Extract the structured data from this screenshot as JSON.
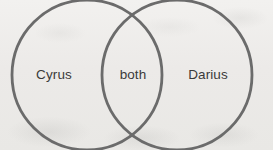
{
  "diagram": {
    "type": "venn-2-set",
    "title": "",
    "background_color": "#edecea",
    "stroke_color": "#6b6b6b",
    "text_color": "#3a3a3a",
    "stroke_width": 2.8,
    "sets": [
      {
        "id": "left",
        "label": "Cyrus",
        "center_x": 87,
        "center_y": 75,
        "radius": 75
      },
      {
        "id": "right",
        "label": "Darius",
        "center_x": 177,
        "center_y": 75,
        "radius": 75
      }
    ],
    "intersection": {
      "id": "both",
      "label": "both"
    }
  }
}
